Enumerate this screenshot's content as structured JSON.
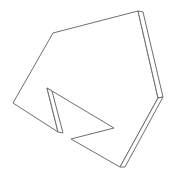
{
  "diagram": {
    "type": "line-drawing",
    "stroke_color": "#6e6e6e",
    "background_color": "#ffffff",
    "stroke_width": 1,
    "front_face_points": "53,33 138,11 158,98 120,167 71,139 114,128 47,88 58,132 13,103",
    "side_face_right_points": "138,11 143,12 163,97 158,98",
    "side_face_lower_right_points": "158,98 163,97 125,167 120,167",
    "side_face_notch_points": "47,88 52,91 63,133 58,132"
  }
}
